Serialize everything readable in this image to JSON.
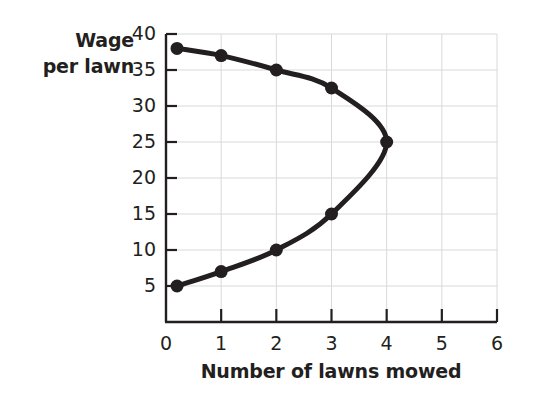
{
  "chart_data": {
    "type": "line",
    "title": "",
    "xlabel": "Number of lawns mowed",
    "ylabel": "Wage per lawn",
    "ylabel_lines": [
      "Wage",
      "per lawn"
    ],
    "xlim": [
      0,
      6
    ],
    "ylim": [
      0,
      40
    ],
    "xticks": [
      0,
      1,
      2,
      3,
      4,
      5,
      6
    ],
    "xtick_labels": [
      "0",
      "1",
      "2",
      "3",
      "4",
      "5",
      "6"
    ],
    "yticks": [
      5,
      10,
      15,
      20,
      25,
      30,
      35,
      40
    ],
    "ytick_labels": [
      "5",
      "10",
      "15",
      "20",
      "25",
      "30",
      "35",
      "40"
    ],
    "grid": true,
    "grid_color": "#d9d9d9",
    "line_color": "#231f20",
    "marker_color": "#231f20",
    "axis_color": "#231f20",
    "legend": "none",
    "curve_shape": "backward-bending (sideways parabola opening left), vertex at right",
    "series": [
      {
        "name": "upper branch",
        "points": [
          {
            "x": 0.2,
            "y": 38
          },
          {
            "x": 1,
            "y": 37
          },
          {
            "x": 2,
            "y": 35
          },
          {
            "x": 3,
            "y": 32.5
          },
          {
            "x": 4,
            "y": 25
          }
        ]
      },
      {
        "name": "lower branch",
        "points": [
          {
            "x": 0.2,
            "y": 5
          },
          {
            "x": 1,
            "y": 7
          },
          {
            "x": 2,
            "y": 10
          },
          {
            "x": 3,
            "y": 15
          },
          {
            "x": 4,
            "y": 25
          }
        ]
      }
    ],
    "markers": [
      {
        "x": 0.2,
        "y": 38
      },
      {
        "x": 1,
        "y": 37
      },
      {
        "x": 2,
        "y": 35
      },
      {
        "x": 3,
        "y": 32.5
      },
      {
        "x": 4,
        "y": 25
      },
      {
        "x": 3,
        "y": 15
      },
      {
        "x": 2,
        "y": 10
      },
      {
        "x": 1,
        "y": 7
      },
      {
        "x": 0.2,
        "y": 5
      }
    ]
  }
}
